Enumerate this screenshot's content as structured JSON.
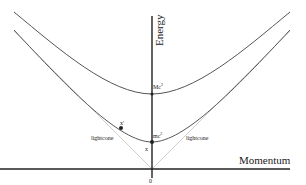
{
  "diagram": {
    "type": "energy-momentum-dispersion",
    "axes": {
      "x_label": "Momentum",
      "y_label": "Energy",
      "origin_label": "0"
    },
    "curves": [
      {
        "name": "heavy-particle-hyperbola",
        "min_label": "Mc",
        "min_sup": "2"
      },
      {
        "name": "light-particle-hyperbola",
        "min_label": "mc",
        "min_sup": "2"
      }
    ],
    "lightcone": {
      "left_label": "lightcone",
      "right_label": "lightcone"
    },
    "points": [
      {
        "label": "x'"
      },
      {
        "label": "x"
      }
    ],
    "colors": {
      "axis": "#222222",
      "curve": "#555555",
      "lightcone": "#cccccc",
      "point": "#222222"
    }
  }
}
